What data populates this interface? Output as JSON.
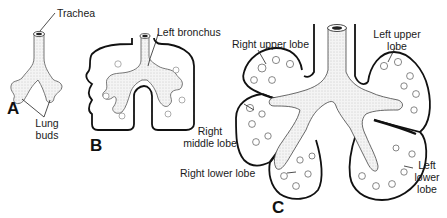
{
  "figure": {
    "panels": [
      {
        "id": "A",
        "label": "A",
        "description": "Early lung buds from trachea"
      },
      {
        "id": "B",
        "label": "B",
        "description": "Branching bronchi within pleural sacs"
      },
      {
        "id": "C",
        "label": "C",
        "description": "Mature lobes of the lungs"
      }
    ],
    "labels": {
      "trachea": "Trachea",
      "lung_buds_1": "Lung",
      "lung_buds_2": "buds",
      "left_bronchus": "Left bronchus",
      "right_upper_lobe": "Right upper lobe",
      "left_upper_lobe_1": "Left upper",
      "left_upper_lobe_2": "lobe",
      "right_middle_lobe_1": "Right",
      "right_middle_lobe_2": "middle lobe",
      "right_lower_lobe": "Right lower lobe",
      "left_lower_lobe_1": "Left",
      "left_lower_lobe_2": "lower",
      "left_lower_lobe_3": "lobe"
    },
    "colors": {
      "ink": "#111111",
      "fill": "#f2f2f2",
      "shade": "#bdbdbd",
      "background": "#ffffff"
    }
  }
}
